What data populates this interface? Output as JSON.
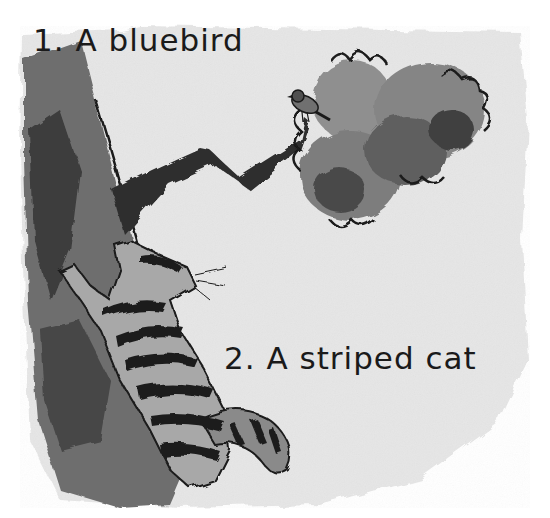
{
  "illustration": {
    "style": "grayscale watercolor and ink",
    "captions": [
      {
        "number": "1.",
        "text": "1. A bluebird"
      },
      {
        "number": "2.",
        "text": "2. A striped cat"
      }
    ],
    "subjects": [
      "bluebird",
      "tree-branch",
      "leaves",
      "tree-trunk",
      "striped-cat"
    ],
    "colors": {
      "background_wash": "#e4e4e4",
      "paper": "#ffffff",
      "ink": "#1a1a1a",
      "trunk_dark": "#3c3c3c",
      "trunk_mid": "#6e6e6e",
      "leaves_mid": "#8a8a8a",
      "leaves_dark": "#4a4a4a"
    }
  }
}
